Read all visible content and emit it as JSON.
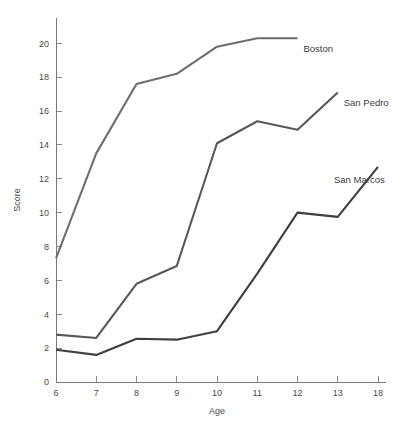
{
  "chart_data": {
    "type": "line",
    "title": "",
    "xlabel": "Age",
    "ylabel": "Score",
    "categories": [
      "6",
      "7",
      "8",
      "9",
      "10",
      "11",
      "12",
      "13",
      "18"
    ],
    "x_tick_labels": [
      "6",
      "7",
      "8",
      "9",
      "10",
      "11",
      "12",
      "13",
      "18"
    ],
    "y_tick_labels": [
      "0",
      "2",
      "4",
      "6",
      "8",
      "10",
      "12",
      "14",
      "16",
      "18",
      "20"
    ],
    "y_ticks": [
      0,
      2,
      4,
      6,
      8,
      10,
      12,
      14,
      16,
      18,
      20
    ],
    "ylim": [
      0,
      21.2
    ],
    "grid": false,
    "legend_position": "inline-end-of-line",
    "series": [
      {
        "name": "Boston",
        "color": "#6e6e6e",
        "label": "Boston",
        "x": [
          "6",
          "7",
          "8",
          "9",
          "10",
          "11",
          "12"
        ],
        "values": [
          7.3,
          13.5,
          17.6,
          18.2,
          19.8,
          20.3,
          20.3
        ]
      },
      {
        "name": "San Pedro",
        "color": "#585858",
        "label": "San Pedro",
        "x": [
          "6",
          "7",
          "8",
          "9",
          "10",
          "11",
          "12",
          "13"
        ],
        "values": [
          2.8,
          2.6,
          5.8,
          6.85,
          14.1,
          15.4,
          14.9,
          17.1
        ]
      },
      {
        "name": "San Marcos",
        "color": "#3f3f3f",
        "label": "San Marcos",
        "x": [
          "6",
          "7",
          "8",
          "9",
          "10",
          "11",
          "12",
          "13",
          "18"
        ],
        "values": [
          1.9,
          1.6,
          2.55,
          2.5,
          3.0,
          6.4,
          10.0,
          9.75,
          12.7
        ]
      }
    ]
  },
  "axes": {
    "x_axis_title": "Age",
    "y_axis_title": "Score"
  },
  "colors": {
    "axis": "#7a7a7a",
    "text": "#4a4a4a",
    "background": "#ffffff"
  }
}
